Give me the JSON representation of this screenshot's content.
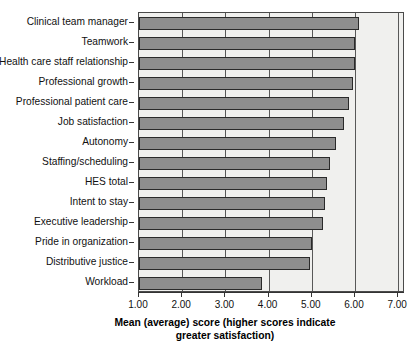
{
  "chart_data": {
    "type": "bar",
    "orientation": "horizontal",
    "title": "",
    "xlabel": "Mean (average) score (higher scores indicate greater satisfaction)",
    "ylabel": "",
    "xlim": [
      1.0,
      7.0
    ],
    "xticks": [
      "1.00",
      "2.00",
      "3.00",
      "4.00",
      "5.00",
      "6.00",
      "7.00"
    ],
    "xtick_values": [
      1,
      2,
      3,
      4,
      5,
      6,
      7
    ],
    "grid": true,
    "legend": "none",
    "categories": [
      "Clinical team manager",
      "Teamwork",
      "Health care staff relationship",
      "Professional growth",
      "Professional patient care",
      "Job satisfaction",
      "Autonomy",
      "Staffing/scheduling",
      "HES total",
      "Intent to stay",
      "Executive leadership",
      "Pride in organization",
      "Distributive justice",
      "Workload"
    ],
    "values": [
      6.1,
      6.0,
      6.0,
      5.95,
      5.85,
      5.75,
      5.57,
      5.42,
      5.35,
      5.3,
      5.25,
      5.0,
      4.95,
      3.85
    ],
    "bar_color": "#8e8e8e",
    "bar_edge_color": "#2a2a2a",
    "plot_background": "#f0f0ee"
  },
  "axis": {
    "x_title_line1": "Mean (average) score (higher scores indicate",
    "x_title_line2": "greater satisfaction)"
  }
}
